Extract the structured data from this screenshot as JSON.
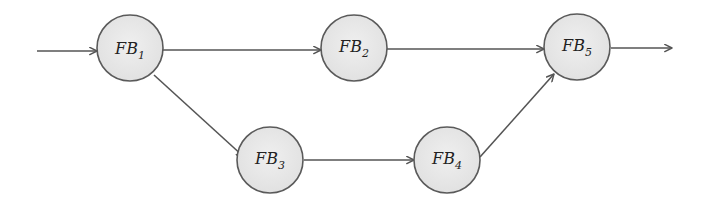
{
  "diagram": {
    "type": "flow",
    "colors": {
      "edge": "#555555",
      "node_fill": "#e8e8e8",
      "node_stroke": "#5a5a5a",
      "text": "#222222"
    },
    "nodes": [
      {
        "id": "FB1",
        "base": "FB",
        "sub": "1",
        "cx": 130,
        "cy": 48
      },
      {
        "id": "FB2",
        "base": "FB",
        "sub": "2",
        "cx": 354,
        "cy": 48
      },
      {
        "id": "FB3",
        "base": "FB",
        "sub": "3",
        "cx": 270,
        "cy": 157
      },
      {
        "id": "FB4",
        "base": "FB",
        "sub": "4",
        "cx": 447,
        "cy": 157
      },
      {
        "id": "FB5",
        "base": "FB",
        "sub": "5",
        "cx": 577,
        "cy": 46
      }
    ],
    "edges": [
      {
        "from": "input",
        "to": "FB1"
      },
      {
        "from": "FB1",
        "to": "FB2"
      },
      {
        "from": "FB1",
        "to": "FB3"
      },
      {
        "from": "FB2",
        "to": "FB5"
      },
      {
        "from": "FB3",
        "to": "FB4"
      },
      {
        "from": "FB4",
        "to": "FB5"
      },
      {
        "from": "FB5",
        "to": "output"
      }
    ]
  }
}
